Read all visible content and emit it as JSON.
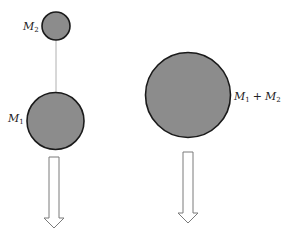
{
  "diagram": {
    "left_panel": {
      "top_body": {
        "label": "M",
        "subscript": "2"
      },
      "bottom_body": {
        "label": "M",
        "subscript": "1"
      },
      "arrow": "down-arrow"
    },
    "right_panel": {
      "combined_body": {
        "label_a": "M",
        "sub_a": "1",
        "operator": "+",
        "label_b": "M",
        "sub_b": "2"
      },
      "arrow": "down-arrow"
    },
    "colors": {
      "body_fill": "#8c8c8c",
      "body_stroke": "#1a1a1a",
      "tether": "#b0b0b0",
      "arrow_stroke": "#7a7a7a"
    }
  }
}
